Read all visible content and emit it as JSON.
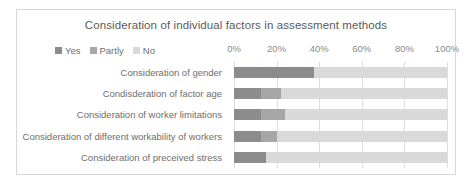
{
  "chart_data": {
    "type": "bar",
    "orientation": "horizontal",
    "stacked": true,
    "normalized_percent": true,
    "title": "Consideration of individual factors in assessment methods",
    "xlabel": "",
    "ylabel": "",
    "xlim": [
      0,
      100
    ],
    "xticks": [
      0,
      20,
      40,
      60,
      80,
      100
    ],
    "xtick_labels": [
      "0%",
      "20%",
      "40%",
      "60%",
      "80%",
      "100%"
    ],
    "grid": true,
    "legend_position": "top-left",
    "categories": [
      "Consideration of gender",
      "Condisderation of factor age",
      "Consideration of worker limitations",
      "Consideration of different workability of workers",
      "Consideration of preceived stress"
    ],
    "series": [
      {
        "name": "Yes",
        "color": "#8c8c8c",
        "values": [
          37.5,
          12.5,
          12.5,
          12.5,
          15.0
        ]
      },
      {
        "name": "Partly",
        "color": "#a6a6a6",
        "values": [
          0.0,
          9.5,
          11.5,
          7.5,
          0.0
        ]
      },
      {
        "name": "No",
        "color": "#d9d9d9",
        "values": [
          62.5,
          78.0,
          76.0,
          80.0,
          85.0
        ]
      }
    ]
  },
  "colors": {
    "title_text": "#5a5a5a",
    "label_text": "#6e6e6e",
    "tick_text": "#8a8a8a",
    "gridline": "#dedede",
    "card_border": "#d6d6d6",
    "background": "#ffffff"
  }
}
